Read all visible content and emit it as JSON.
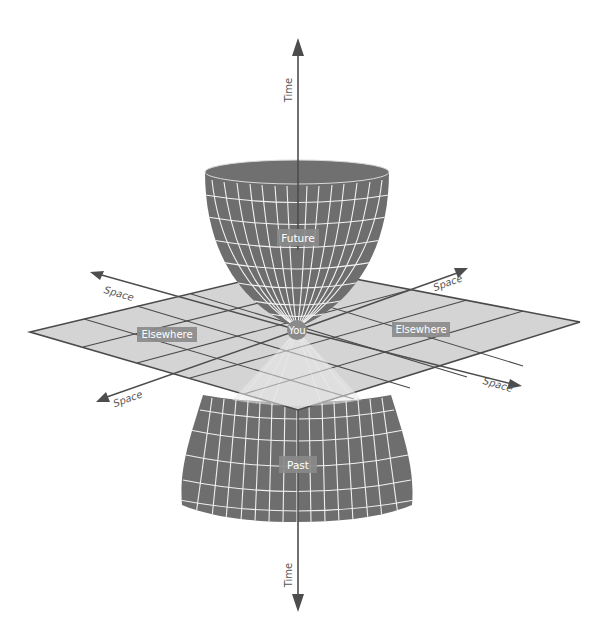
{
  "diagram": {
    "labels": {
      "time_up": "Time",
      "time_down": "Time",
      "future": "Future",
      "past": "Past",
      "you": "You",
      "elsewhere_left": "Elsewhere",
      "elsewhere_right": "Elsewhere",
      "space_upper_left": "Space",
      "space_upper_right": "Space",
      "space_lower_left": "Space",
      "space_lower_right": "Space"
    },
    "colors": {
      "cone": "#6e6e6e",
      "cone_grid": "#f2f2f2",
      "plane": "#d4d4d4",
      "plane_grid": "#4a4a4a",
      "axis": "#4d4d4d",
      "label_box": "#8a8a8a",
      "label_text": "#ffffff",
      "axis_text": "#555555"
    }
  }
}
